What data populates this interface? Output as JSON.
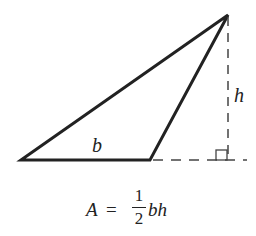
{
  "diagram": {
    "colors": {
      "stroke": "#222222",
      "background": "#ffffff"
    },
    "triangle": {
      "vertices": [
        [
          21,
          160
        ],
        [
          150,
          160
        ],
        [
          228,
          15
        ]
      ],
      "stroke_width": 3
    },
    "height_line": {
      "from": [
        228,
        15
      ],
      "to": [
        228,
        160
      ],
      "style": "dashed"
    },
    "base_extension": {
      "from": [
        150,
        160
      ],
      "to": [
        246,
        160
      ],
      "style": "dashed"
    },
    "right_angle_marker": {
      "x": 216,
      "y": 150,
      "size": 10
    },
    "labels": {
      "base": "b",
      "height": "h"
    },
    "formula": {
      "lhs": "A",
      "equals": "=",
      "numerator": "1",
      "denominator": "2",
      "rhs_vars": "bh"
    }
  }
}
